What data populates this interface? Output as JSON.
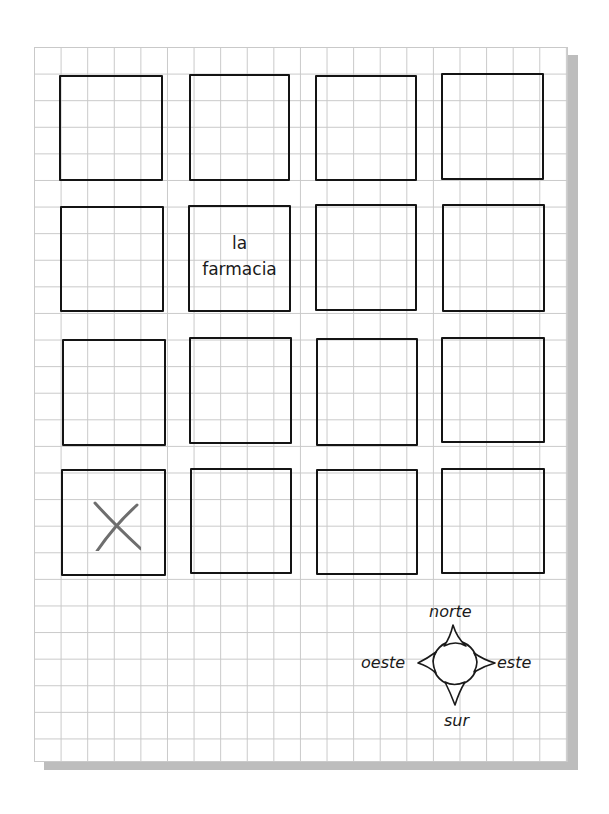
{
  "map": {
    "grid_cell_px": 26.6,
    "grid_color": "#c9c9c9",
    "block_color": "#141414",
    "blocks": [
      {
        "row": 1,
        "col": 1,
        "label": "",
        "marker": ""
      },
      {
        "row": 1,
        "col": 2,
        "label": "",
        "marker": ""
      },
      {
        "row": 1,
        "col": 3,
        "label": "",
        "marker": ""
      },
      {
        "row": 1,
        "col": 4,
        "label": "",
        "marker": ""
      },
      {
        "row": 2,
        "col": 1,
        "label": "",
        "marker": ""
      },
      {
        "row": 2,
        "col": 2,
        "label_line1": "la",
        "label_line2": "farmacia",
        "marker": ""
      },
      {
        "row": 2,
        "col": 3,
        "label": "",
        "marker": ""
      },
      {
        "row": 2,
        "col": 4,
        "label": "",
        "marker": ""
      },
      {
        "row": 3,
        "col": 1,
        "label": "",
        "marker": ""
      },
      {
        "row": 3,
        "col": 2,
        "label": "",
        "marker": ""
      },
      {
        "row": 3,
        "col": 3,
        "label": "",
        "marker": ""
      },
      {
        "row": 3,
        "col": 4,
        "label": "",
        "marker": ""
      },
      {
        "row": 4,
        "col": 1,
        "label": "",
        "marker": "X"
      },
      {
        "row": 4,
        "col": 2,
        "label": "",
        "marker": ""
      },
      {
        "row": 4,
        "col": 3,
        "label": "",
        "marker": ""
      },
      {
        "row": 4,
        "col": 4,
        "label": "",
        "marker": ""
      }
    ],
    "x_mark_color": "#6e6e6e"
  },
  "compass": {
    "north": "norte",
    "south": "sur",
    "east": "este",
    "west": "oeste"
  }
}
